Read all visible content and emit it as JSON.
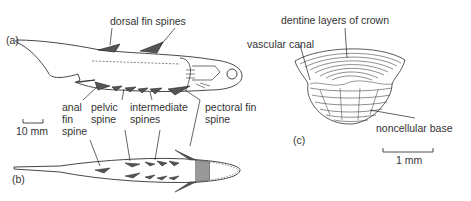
{
  "figure": {
    "panels": [
      {
        "id": "a",
        "label": "(a)",
        "view": "lateral view of fish"
      },
      {
        "id": "b",
        "label": "(b)",
        "view": "ventral view of fish"
      },
      {
        "id": "c",
        "label": "(c)",
        "view": "scale section"
      }
    ],
    "labels": {
      "dorsal_fin_spines": "dorsal fin spines",
      "anal_fin_spine": [
        "anal",
        "fin",
        "spine"
      ],
      "pelvic_spine": [
        "pelvic",
        "spine"
      ],
      "intermediate_spines": [
        "intermediate",
        "spines"
      ],
      "pectoral_fin_spine": [
        "pectoral fin",
        "spine"
      ],
      "dentine_layers": "dentine layers of crown",
      "vascular_canal": "vascular canal",
      "noncellular_base": "noncellular base"
    },
    "scale_bars": {
      "fish": "10 mm",
      "scale": "1 mm"
    }
  }
}
